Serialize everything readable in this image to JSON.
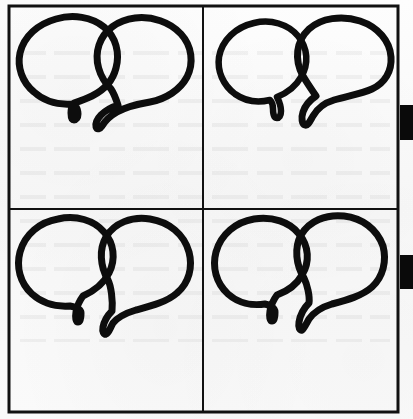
{
  "page": {
    "kind": "scanned-document-figure",
    "width": 413,
    "height": 419,
    "background_color": "#fbfbfb",
    "ink_color": "#0d0d0d",
    "frame_color": "#111111",
    "caption": ""
  },
  "frame": {
    "name": "outer-rectangle-border",
    "x": 9,
    "y": 6,
    "width": 389,
    "height": 406,
    "stroke_width": 3,
    "divider_vertical_x": 203,
    "divider_horizontal_y": 209,
    "divider_stroke_width": 2
  },
  "panels": [
    {
      "id": "panel-top-left",
      "position": "top-left",
      "label": "",
      "relation": "overlapping",
      "bubble_count": 2,
      "bubbles": [
        {
          "side": "left",
          "tail": "down",
          "size": "medium"
        },
        {
          "side": "right",
          "tail": "down",
          "size": "medium"
        }
      ]
    },
    {
      "id": "panel-top-right",
      "position": "top-right",
      "label": "",
      "relation": "separate",
      "bubble_count": 2,
      "bubbles": [
        {
          "side": "left",
          "tail": "down",
          "size": "small"
        },
        {
          "side": "right",
          "tail": "down",
          "size": "large"
        }
      ]
    },
    {
      "id": "panel-bottom-left",
      "position": "bottom-left",
      "label": "",
      "relation": "touching",
      "bubble_count": 2,
      "bubbles": [
        {
          "side": "left",
          "tail": "down",
          "size": "medium"
        },
        {
          "side": "right",
          "tail": "down",
          "size": "medium"
        }
      ]
    },
    {
      "id": "panel-bottom-right",
      "position": "bottom-right",
      "label": "",
      "relation": "touching",
      "bubble_count": 2,
      "bubbles": [
        {
          "side": "left",
          "tail": "down",
          "size": "medium"
        },
        {
          "side": "right",
          "tail": "down",
          "size": "medium"
        }
      ]
    }
  ],
  "edge_markers": [
    {
      "id": "edge-marker-upper",
      "x": 400,
      "y": 105,
      "width": 13,
      "height": 35,
      "color": "#0a0a0a"
    },
    {
      "id": "edge-marker-lower",
      "x": 400,
      "y": 255,
      "width": 13,
      "height": 34,
      "color": "#0a0a0a"
    }
  ]
}
